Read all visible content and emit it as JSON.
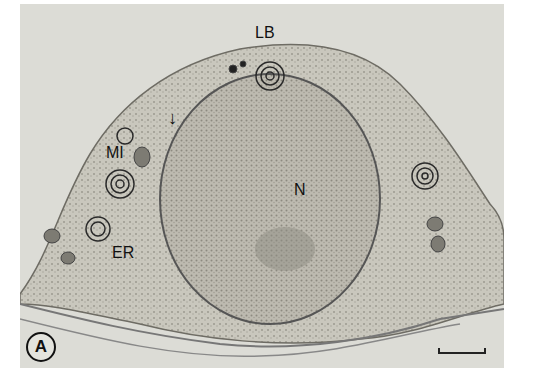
{
  "figure": {
    "panel_label": "A",
    "labels": {
      "lamellar_body": "LB",
      "mitochondria": "MI",
      "nucleus": "N",
      "endoplasmic_reticulum": "ER"
    },
    "arrow": "↓",
    "colors": {
      "background": "#dcdcd6",
      "cytoplasm": "#c8c6bc",
      "nucleus": "#b9b6ac",
      "dark": "#2a2a2a"
    }
  }
}
